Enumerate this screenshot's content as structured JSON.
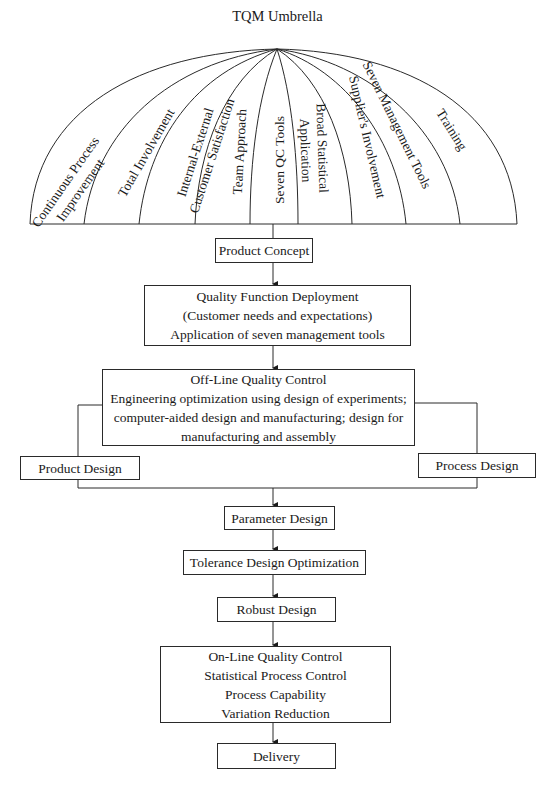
{
  "title": "TQM Umbrella",
  "umbrella": {
    "ribs": [
      {
        "lines": [
          "Continuous Process",
          "Improvement"
        ]
      },
      {
        "lines": [
          "Total Involvement"
        ]
      },
      {
        "lines": [
          "Internal-External",
          "Customer Satisfaction"
        ]
      },
      {
        "lines": [
          "Team Approach"
        ]
      },
      {
        "lines": [
          "Seven QC Tools"
        ]
      },
      {
        "lines": [
          "Broad Statistical",
          "Application"
        ]
      },
      {
        "lines": [
          "Supplier's Involvement"
        ]
      },
      {
        "lines": [
          "Seven Management Tools"
        ]
      },
      {
        "lines": [
          "Training"
        ]
      }
    ]
  },
  "flow": {
    "product_concept": "Product Concept",
    "qfd": {
      "lines": [
        "Quality Function Deployment",
        "(Customer needs and expectations)",
        "Application of seven management tools"
      ]
    },
    "offline": {
      "lines": [
        "Off-Line Quality Control",
        "Engineering optimization using design of experiments;",
        "computer-aided design and manufacturing; design for",
        "manufacturing and assembly"
      ]
    },
    "product_design": "Product Design",
    "process_design": "Process Design",
    "parameter_design": "Parameter Design",
    "tolerance_design": "Tolerance Design Optimization",
    "robust_design": "Robust Design",
    "online": {
      "lines": [
        "On-Line Quality Control",
        "Statistical Process Control",
        "Process Capability",
        "Variation Reduction"
      ]
    },
    "delivery": "Delivery"
  }
}
